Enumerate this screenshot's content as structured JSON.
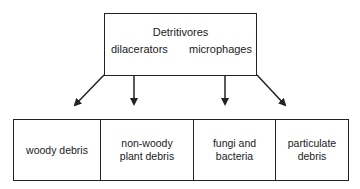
{
  "diagram": {
    "top_node": {
      "title": "Detritivores",
      "left_label": "dilacerators",
      "right_label": "microphages"
    },
    "bottom_nodes": [
      {
        "label": "woody debris"
      },
      {
        "label": "non-woody plant debris"
      },
      {
        "label": "fungi and bacteria"
      },
      {
        "label": "particulate debris"
      }
    ],
    "edges": [
      {
        "from": "Detritivores",
        "to": "woody debris"
      },
      {
        "from": "Detritivores",
        "to": "non-woody plant debris"
      },
      {
        "from": "Detritivores",
        "to": "fungi and bacteria"
      },
      {
        "from": "Detritivores",
        "to": "particulate debris"
      }
    ]
  }
}
